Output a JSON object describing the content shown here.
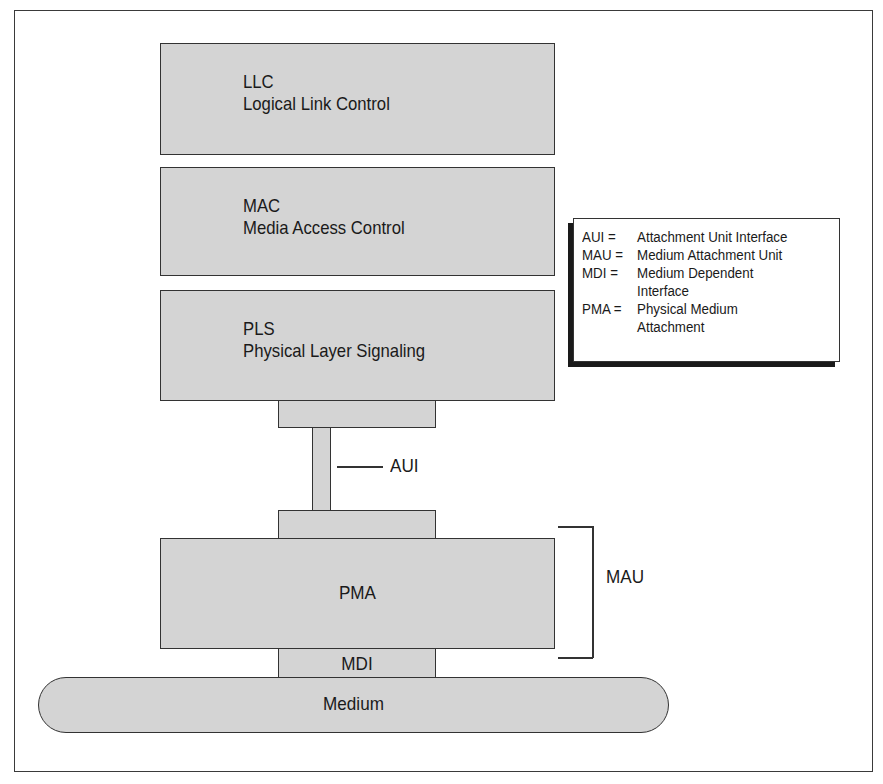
{
  "diagram": {
    "layers": [
      {
        "abbr": "LLC",
        "name": "Logical Link Control"
      },
      {
        "abbr": "MAC",
        "name": "Media Access Control"
      },
      {
        "abbr": "PLS",
        "name": "Physical Layer Signaling"
      }
    ],
    "aui_label": "AUI",
    "pma_label": "PMA",
    "mdi_label": "MDI",
    "medium_label": "Medium",
    "mau_bracket_label": "MAU",
    "legend": [
      {
        "abbr": "AUI =",
        "line1": "Attachment Unit Interface",
        "line2": ""
      },
      {
        "abbr": "MAU =",
        "line1": "Medium Attachment Unit",
        "line2": ""
      },
      {
        "abbr": "MDI =",
        "line1": "Medium Dependent",
        "line2": "Interface"
      },
      {
        "abbr": "PMA =",
        "line1": "Physical Medium",
        "line2": "Attachment"
      }
    ],
    "colors": {
      "box_fill": "#d4d4d4",
      "outline": "#333333",
      "background": "#ffffff"
    }
  }
}
